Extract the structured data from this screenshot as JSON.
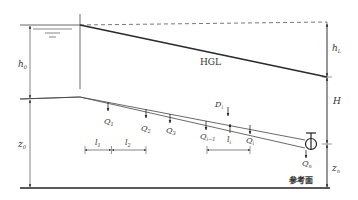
{
  "diagram": {
    "labels": {
      "h0": {
        "main": "h",
        "sub": "0"
      },
      "hL": {
        "main": "h",
        "sub": "L"
      },
      "HGL": "HGL",
      "H": "H",
      "z0": {
        "main": "z",
        "sub": "0"
      },
      "zn": {
        "main": "z",
        "sub": "n"
      },
      "Di": {
        "main": "D",
        "sub": "i"
      },
      "Q1": {
        "main": "Q",
        "sub": "1"
      },
      "Q2": {
        "main": "Q",
        "sub": "2"
      },
      "Q3": {
        "main": "Q",
        "sub": "3"
      },
      "Qi_1": {
        "main": "Q",
        "sub": "i−1"
      },
      "Qi": {
        "main": "Q",
        "sub": "i"
      },
      "Qn": {
        "main": "Q",
        "sub": "n"
      },
      "l1": {
        "main": "l",
        "sub": "1"
      },
      "l2": {
        "main": "l",
        "sub": "2"
      },
      "li": {
        "main": "l",
        "sub": "i"
      },
      "reference_plane": "参考面"
    },
    "colors": {
      "line": "#333333",
      "hgl": "#2a2a2a",
      "dashed": "#555555",
      "ground": "#222222"
    }
  }
}
